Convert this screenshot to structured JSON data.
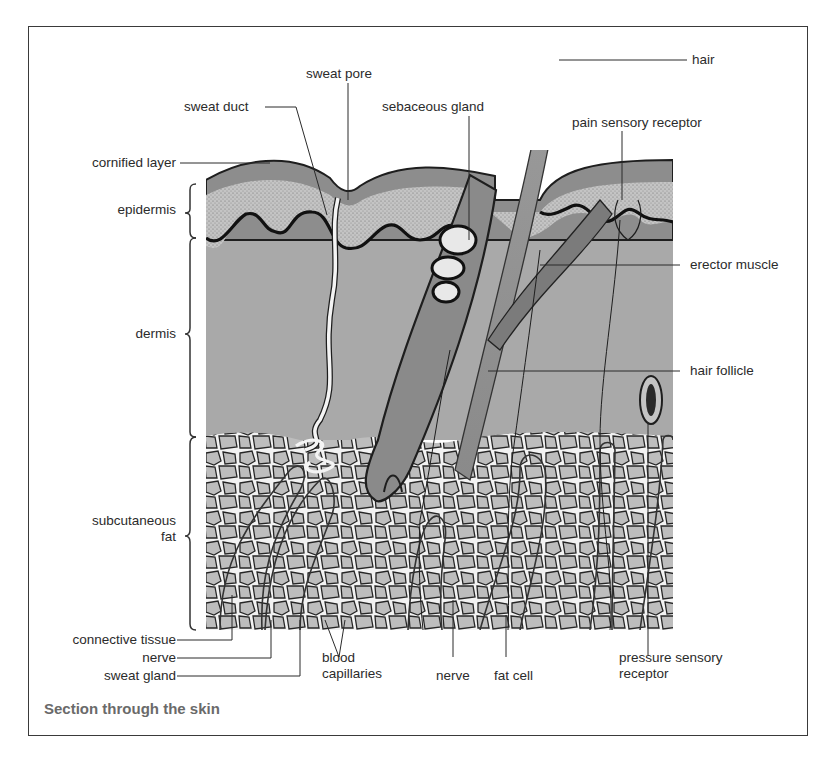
{
  "figure": {
    "title": "Section through the skin",
    "colors": {
      "frame": "#3a3a3a",
      "cornified_layer": "#8e8e8e",
      "epidermis_stipple": "#b8b8b8",
      "dermis": "#a8a8a8",
      "fat_cell": "#bdbdbd",
      "outline": "#1e1e1e",
      "sweat_duct": "#f4f4f4",
      "hair": "#909090",
      "caption": "#6a6a6a"
    }
  },
  "labels": {
    "hair": "hair",
    "sweat_pore": "sweat pore",
    "sweat_duct": "sweat duct",
    "sebaceous_gland": "sebaceous gland",
    "pain_sensory_receptor": "pain sensory receptor",
    "cornified_layer": "cornified layer",
    "epidermis": "epidermis",
    "erector_muscle": "erector muscle",
    "dermis": "dermis",
    "hair_follicle": "hair follicle",
    "subcutaneous_fat_line1": "subcutaneous",
    "subcutaneous_fat_line2": "fat",
    "connective_tissue": "connective tissue",
    "nerve_left": "nerve",
    "sweat_gland": "sweat gland",
    "blood_capillaries_line1": "blood",
    "blood_capillaries_line2": "capillaries",
    "nerve_bottom": "nerve",
    "fat_cell": "fat cell",
    "pressure_sensory_receptor_line1": "pressure sensory",
    "pressure_sensory_receptor_line2": "receptor"
  }
}
